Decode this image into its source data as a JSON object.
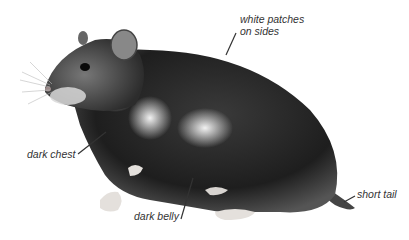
{
  "illustration": {
    "subject": "hamster",
    "style": "grayscale pencil illustration"
  },
  "labels": {
    "white_patches_line1": "white patches",
    "white_patches_line2": "on sides",
    "dark_chest": "dark chest",
    "dark_belly": "dark belly",
    "short_tail": "short tail"
  }
}
